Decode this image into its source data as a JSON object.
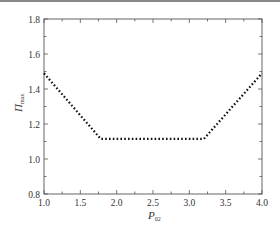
{
  "chart_data": {
    "type": "line",
    "title": "",
    "xlabel": "P_02",
    "xlabel_main": "P",
    "xlabel_sub": "02",
    "ylabel": "Π_max",
    "ylabel_main": "Π",
    "ylabel_sub": "max",
    "xlim": [
      1.0,
      4.0
    ],
    "ylim": [
      0.8,
      1.8
    ],
    "xticks": [
      "1.0",
      "1.5",
      "2.0",
      "2.5",
      "3.0",
      "3.5",
      "4.0"
    ],
    "yticks": [
      "0.8",
      "1.0",
      "1.2",
      "1.4",
      "1.6",
      "1.8"
    ],
    "grid": false,
    "legend": null,
    "series": [
      {
        "name": "Π_max",
        "style": "dotted",
        "color": "#111111",
        "x": [
          1.0,
          1.78,
          3.2,
          4.0
        ],
        "y": [
          1.49,
          1.115,
          1.115,
          1.49
        ]
      }
    ]
  }
}
